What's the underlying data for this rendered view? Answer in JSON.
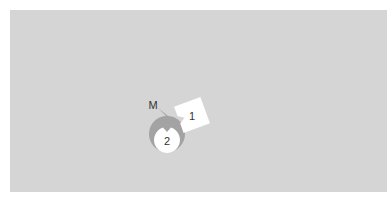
{
  "scene": {
    "background_color": "#d5d5d5",
    "nodes": [
      {
        "id": "M",
        "label": "M",
        "shape": "circle",
        "fill": "#a3a3a3",
        "cx": 153,
        "cy": 105,
        "r": 18,
        "notch": "bottom-right"
      },
      {
        "id": "1",
        "label": "1",
        "shape": "square",
        "fill": "#ffffff",
        "cx": 192,
        "cy": 115,
        "size": 28,
        "rotation": -20,
        "notch": "left"
      },
      {
        "id": "2",
        "label": "2",
        "shape": "circle",
        "fill": "#ffffff",
        "cx": 167,
        "cy": 140,
        "r": 13,
        "notch": "top"
      }
    ]
  }
}
